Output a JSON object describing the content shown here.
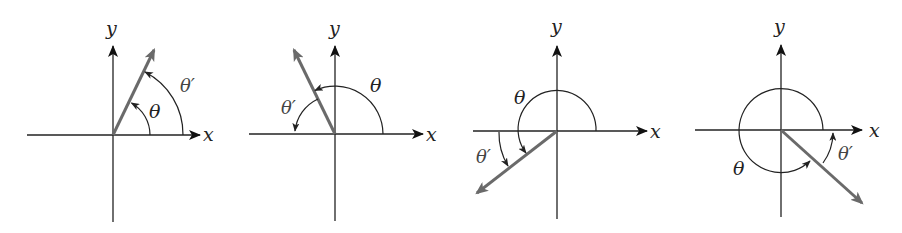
{
  "figure": {
    "panels": [
      {
        "id": "quadrant-1",
        "x_label": "x",
        "y_label": "y",
        "angle_label": "θ",
        "reference_angle_label": "θ′",
        "terminal_side_direction": "up-right"
      },
      {
        "id": "quadrant-2",
        "x_label": "x",
        "y_label": "y",
        "angle_label": "θ",
        "reference_angle_label": "θ′",
        "terminal_side_direction": "up-left"
      },
      {
        "id": "quadrant-3",
        "x_label": "x",
        "y_label": "y",
        "angle_label": "θ",
        "reference_angle_label": "θ′",
        "terminal_side_direction": "down-left"
      },
      {
        "id": "quadrant-4",
        "x_label": "x",
        "y_label": "y",
        "angle_label": "θ",
        "reference_angle_label": "θ′",
        "terminal_side_direction": "down-right"
      }
    ]
  },
  "colors": {
    "axis": "#222222",
    "terminal_ray": "#6a6a6a",
    "background": "#ffffff"
  }
}
